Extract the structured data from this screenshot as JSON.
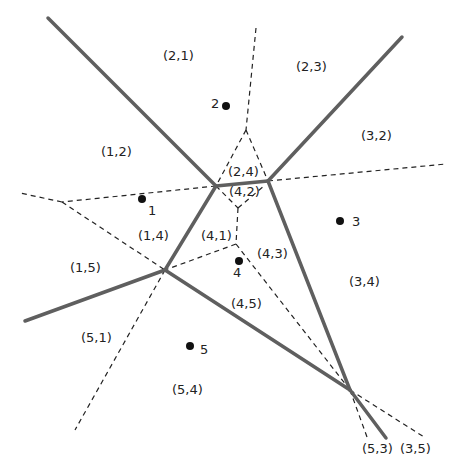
{
  "diagram": {
    "type": "voronoi-order-k-diagram",
    "colors": {
      "solid_edge": "#5f5f5f",
      "dashed_edge": "#222222",
      "site": "#111111",
      "text": "#222222",
      "background": "#ffffff"
    },
    "sites": [
      {
        "id": "1",
        "label": "1",
        "x": 142,
        "y": 199,
        "lx": 148,
        "ly": 215
      },
      {
        "id": "2",
        "label": "2",
        "x": 226,
        "y": 106,
        "lx": 211,
        "ly": 108
      },
      {
        "id": "3",
        "label": "3",
        "x": 340,
        "y": 221,
        "lx": 352,
        "ly": 226
      },
      {
        "id": "4",
        "label": "4",
        "x": 239,
        "y": 261,
        "lx": 233,
        "ly": 277
      },
      {
        "id": "5",
        "label": "5",
        "x": 190,
        "y": 346,
        "lx": 200,
        "ly": 354
      }
    ],
    "region_labels": [
      {
        "text": "(2,1)",
        "x": 163,
        "y": 60
      },
      {
        "text": "(2,3)",
        "x": 296,
        "y": 71
      },
      {
        "text": "(1,2)",
        "x": 101,
        "y": 156
      },
      {
        "text": "(3,2)",
        "x": 361,
        "y": 140
      },
      {
        "text": "(2,4)",
        "x": 228,
        "y": 176
      },
      {
        "text": "(4,2)",
        "x": 229,
        "y": 196
      },
      {
        "text": "(1,4)",
        "x": 138,
        "y": 240
      },
      {
        "text": "(4,1)",
        "x": 201,
        "y": 240
      },
      {
        "text": "(4,3)",
        "x": 257,
        "y": 258
      },
      {
        "text": "(1,5)",
        "x": 70,
        "y": 272
      },
      {
        "text": "(3,4)",
        "x": 349,
        "y": 286
      },
      {
        "text": "(4,5)",
        "x": 231,
        "y": 308
      },
      {
        "text": "(5,1)",
        "x": 81,
        "y": 342
      },
      {
        "text": "(5,4)",
        "x": 172,
        "y": 394
      },
      {
        "text": "(5,3)",
        "x": 362,
        "y": 453
      },
      {
        "text": "(3,5)",
        "x": 400,
        "y": 453
      }
    ],
    "solid_edges": [
      {
        "x1": 48,
        "y1": 18,
        "x2": 216,
        "y2": 186
      },
      {
        "x1": 216,
        "y1": 186,
        "x2": 268,
        "y2": 181
      },
      {
        "x1": 268,
        "y1": 181,
        "x2": 402,
        "y2": 37
      },
      {
        "x1": 216,
        "y1": 186,
        "x2": 165,
        "y2": 270
      },
      {
        "x1": 165,
        "y1": 270,
        "x2": 25,
        "y2": 321
      },
      {
        "x1": 268,
        "y1": 181,
        "x2": 350,
        "y2": 390
      },
      {
        "x1": 165,
        "y1": 270,
        "x2": 350,
        "y2": 390
      },
      {
        "x1": 350,
        "y1": 390,
        "x2": 386,
        "y2": 438
      }
    ],
    "dashed_edges": [
      {
        "x1": 256,
        "y1": 28,
        "x2": 246,
        "y2": 130
      },
      {
        "x1": 246,
        "y1": 130,
        "x2": 216,
        "y2": 186
      },
      {
        "x1": 246,
        "y1": 130,
        "x2": 268,
        "y2": 181
      },
      {
        "x1": 216,
        "y1": 186,
        "x2": 62,
        "y2": 202
      },
      {
        "x1": 62,
        "y1": 202,
        "x2": 20,
        "y2": 193
      },
      {
        "x1": 268,
        "y1": 181,
        "x2": 446,
        "y2": 164
      },
      {
        "x1": 62,
        "y1": 202,
        "x2": 165,
        "y2": 270
      },
      {
        "x1": 216,
        "y1": 186,
        "x2": 238,
        "y2": 208
      },
      {
        "x1": 238,
        "y1": 208,
        "x2": 264,
        "y2": 186
      },
      {
        "x1": 238,
        "y1": 208,
        "x2": 236,
        "y2": 244
      },
      {
        "x1": 236,
        "y1": 244,
        "x2": 165,
        "y2": 270
      },
      {
        "x1": 236,
        "y1": 244,
        "x2": 350,
        "y2": 390
      },
      {
        "x1": 165,
        "y1": 270,
        "x2": 75,
        "y2": 430
      },
      {
        "x1": 350,
        "y1": 390,
        "x2": 367,
        "y2": 437
      },
      {
        "x1": 350,
        "y1": 390,
        "x2": 424,
        "y2": 437
      }
    ]
  }
}
